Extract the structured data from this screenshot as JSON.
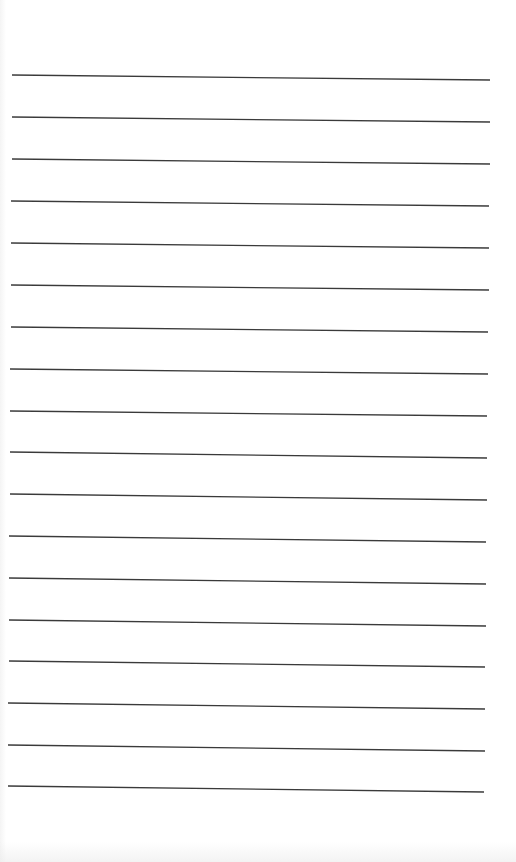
{
  "page": {
    "type": "blank lined paper",
    "background_color": "#ffffff",
    "line_color": "#3a3a3a",
    "line_count": 18,
    "lines": [
      {
        "x1": 12,
        "y1": 75,
        "x2": 490,
        "y2": 80
      },
      {
        "x1": 12,
        "y1": 117,
        "x2": 490,
        "y2": 122
      },
      {
        "x1": 12,
        "y1": 159,
        "x2": 490,
        "y2": 164
      },
      {
        "x1": 11,
        "y1": 201,
        "x2": 489,
        "y2": 206
      },
      {
        "x1": 11,
        "y1": 243,
        "x2": 489,
        "y2": 248
      },
      {
        "x1": 11,
        "y1": 285,
        "x2": 489,
        "y2": 290
      },
      {
        "x1": 11,
        "y1": 327,
        "x2": 488,
        "y2": 332
      },
      {
        "x1": 10,
        "y1": 369,
        "x2": 488,
        "y2": 374
      },
      {
        "x1": 10,
        "y1": 411,
        "x2": 487,
        "y2": 416
      },
      {
        "x1": 10,
        "y1": 452,
        "x2": 487,
        "y2": 458
      },
      {
        "x1": 10,
        "y1": 494,
        "x2": 487,
        "y2": 500
      },
      {
        "x1": 9,
        "y1": 536,
        "x2": 486,
        "y2": 542
      },
      {
        "x1": 9,
        "y1": 578,
        "x2": 486,
        "y2": 584
      },
      {
        "x1": 9,
        "y1": 620,
        "x2": 486,
        "y2": 626
      },
      {
        "x1": 9,
        "y1": 661,
        "x2": 485,
        "y2": 667
      },
      {
        "x1": 8,
        "y1": 703,
        "x2": 485,
        "y2": 709
      },
      {
        "x1": 8,
        "y1": 745,
        "x2": 485,
        "y2": 751
      },
      {
        "x1": 8,
        "y1": 786,
        "x2": 484,
        "y2": 792
      }
    ]
  }
}
